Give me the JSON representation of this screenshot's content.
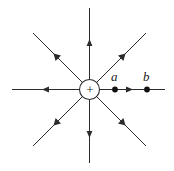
{
  "figure": {
    "kind": "physics-diagram",
    "width": 174,
    "height": 171,
    "background_color": "#ffffff",
    "line_color": "#2b2b2b",
    "text_color": "#1a1a1a"
  },
  "charge": {
    "sign_label": "+",
    "polarity": "positive",
    "center_x": 89.5,
    "center_y": 89.5,
    "radius": 10
  },
  "field_lines": [
    {
      "name": "right",
      "angle_deg": 0,
      "arrow_outward": true
    },
    {
      "name": "upper-right",
      "angle_deg": 45,
      "arrow_outward": true
    },
    {
      "name": "up",
      "angle_deg": 90,
      "arrow_outward": true
    },
    {
      "name": "upper-left",
      "angle_deg": 135,
      "arrow_outward": true
    },
    {
      "name": "left",
      "angle_deg": 180,
      "arrow_outward": true
    },
    {
      "name": "lower-left",
      "angle_deg": 225,
      "arrow_outward": true
    },
    {
      "name": "down",
      "angle_deg": 270,
      "arrow_outward": true
    },
    {
      "name": "lower-right",
      "angle_deg": 315,
      "arrow_outward": true
    }
  ],
  "points": [
    {
      "id": "a",
      "label": "a",
      "x": 115,
      "y": 89.5,
      "label_x": 111,
      "label_y": 70
    },
    {
      "id": "b",
      "label": "b",
      "x": 147,
      "y": 89.5,
      "label_x": 143,
      "label_y": 70
    }
  ]
}
